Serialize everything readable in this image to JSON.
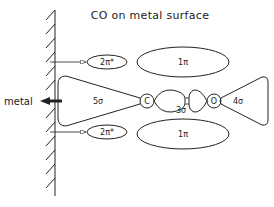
{
  "title": "CO on metal surface",
  "surface": {
    "label": "metal"
  },
  "orbitals": {
    "top_2pi_star": {
      "label": "2π*"
    },
    "top_1pi": {
      "label": "1π"
    },
    "sigma5": {
      "label": "5σ"
    },
    "sigma3": {
      "label": "3σ"
    },
    "sigma4": {
      "label": "4σ"
    },
    "bottom_2pi_star": {
      "label": "2π*"
    },
    "bottom_1pi": {
      "label": "1π"
    }
  },
  "atoms": {
    "carbon": {
      "label": "C"
    },
    "oxygen": {
      "label": "O"
    }
  },
  "colors": {
    "line": "#222222",
    "background": "#ffffff"
  }
}
